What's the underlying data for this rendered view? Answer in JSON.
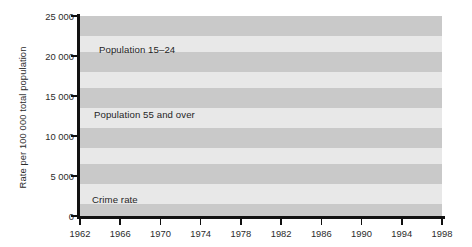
{
  "chart_data": {
    "type": "line",
    "title": "",
    "xlabel": "",
    "ylabel": "Rate per 100 000 total population",
    "xlim": [
      1962,
      1998
    ],
    "ylim": [
      0,
      25000
    ],
    "grid": "horizontal-alternating-bands",
    "legend_position": "inline-annotations",
    "xticks": [
      1962,
      1966,
      1970,
      1974,
      1978,
      1982,
      1986,
      1990,
      1994,
      1998
    ],
    "xtick_labels": [
      "1962",
      "1966",
      "1970",
      "1974",
      "1978",
      "1982",
      "1986",
      "1990",
      "1994",
      "1998"
    ],
    "yticks": [
      0,
      5000,
      10000,
      15000,
      20000,
      25000
    ],
    "ytick_labels": [
      "0",
      "5 000",
      "10 000",
      "15 000",
      "20 000",
      "25 000"
    ],
    "x": [
      1962,
      1963,
      1964,
      1965,
      1966,
      1967,
      1968,
      1969,
      1970,
      1971,
      1972,
      1973,
      1974,
      1975,
      1976,
      1977,
      1978,
      1979,
      1980,
      1981,
      1982,
      1983,
      1984,
      1985,
      1986,
      1987,
      1988,
      1989,
      1990,
      1991,
      1992,
      1993,
      1994,
      1995,
      1996,
      1997,
      1998
    ],
    "series": [
      {
        "name": "Population 15-24",
        "label": "Population 15–24",
        "style": "solid",
        "color": "#000000",
        "width": 2.2,
        "values": [
          14800,
          15000,
          15300,
          15700,
          16200,
          16700,
          16900,
          17000,
          17100,
          17500,
          17900,
          18300,
          18700,
          19000,
          19400,
          19700,
          19850,
          19900,
          19900,
          19800,
          19750,
          19500,
          19100,
          18500,
          17700,
          16800,
          15800,
          14900,
          14200,
          13800,
          13650,
          13600,
          13600,
          13600,
          13600,
          13600,
          13600
        ]
      },
      {
        "name": "Population 55 and over",
        "label": "Population 55 and over",
        "style": "solid",
        "color": "#8c8c8c",
        "width": 2.0,
        "values": [
          14300,
          14450,
          14600,
          14750,
          14900,
          15050,
          15200,
          15350,
          15500,
          15700,
          15900,
          16100,
          16300,
          16500,
          16700,
          16900,
          17100,
          17300,
          17500,
          17700,
          17900,
          18100,
          18300,
          18500,
          18700,
          18900,
          19100,
          19250,
          19400,
          19500,
          19700,
          20100,
          20600,
          21000,
          21300,
          21600,
          21800
        ]
      },
      {
        "name": "Crime rate",
        "label": "Crime rate",
        "style": "dashed",
        "color": "#000000",
        "width": 2.2,
        "values": [
          2600,
          2800,
          3050,
          3300,
          3550,
          3800,
          4000,
          4150,
          4250,
          4450,
          4650,
          4900,
          5200,
          5600,
          6000,
          6400,
          6800,
          7150,
          7300,
          7400,
          7350,
          7250,
          7200,
          7300,
          7500,
          7700,
          7900,
          8200,
          8900,
          10100,
          10300,
          9800,
          9200,
          8700,
          8400,
          8000,
          7700
        ]
      }
    ],
    "annotations": [
      {
        "name": "population-15-24-label",
        "text": "Population 15–24"
      },
      {
        "name": "population-55-over-label",
        "text": "Population 55 and over"
      },
      {
        "name": "crime-rate-label",
        "text": "Crime rate"
      }
    ],
    "bands": [
      {
        "from": 25000,
        "to": 22500,
        "color": "#c9c9c9"
      },
      {
        "from": 22500,
        "to": 20500,
        "color": "#e8e8e8"
      },
      {
        "from": 20500,
        "to": 18000,
        "color": "#c9c9c9"
      },
      {
        "from": 18000,
        "to": 16000,
        "color": "#e8e8e8"
      },
      {
        "from": 16000,
        "to": 13500,
        "color": "#c9c9c9"
      },
      {
        "from": 13500,
        "to": 11000,
        "color": "#e8e8e8"
      },
      {
        "from": 11000,
        "to": 8500,
        "color": "#c9c9c9"
      },
      {
        "from": 8500,
        "to": 6500,
        "color": "#e8e8e8"
      },
      {
        "from": 6500,
        "to": 4000,
        "color": "#c9c9c9"
      },
      {
        "from": 4000,
        "to": 1500,
        "color": "#e8e8e8"
      },
      {
        "from": 1500,
        "to": 0,
        "color": "#c9c9c9"
      }
    ]
  }
}
